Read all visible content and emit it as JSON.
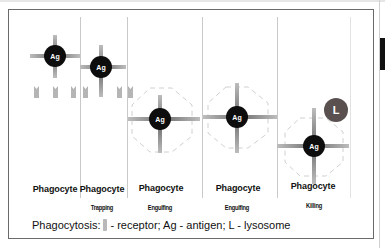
{
  "diagram": {
    "title": "Phagocytosis",
    "colors": {
      "antigen": "#0d0d0d",
      "antigen_text": "#ffffff",
      "arms": "#8a8a8a",
      "receptor": "#b5b5b5",
      "lysosome": "#5a5050",
      "membrane_dash": "#d2d2d2",
      "divider": "#c9c9c9"
    },
    "panels": [
      {
        "cell_label": "Phagocyte",
        "stage": "",
        "antigen": {
          "label": "Ag",
          "cx": 55,
          "cy": 56
        }
      },
      {
        "cell_label": "Phagocyte",
        "stage": "Trapping",
        "antigen": {
          "label": "Ag",
          "cx": 101,
          "cy": 67
        }
      },
      {
        "cell_label": "Phagocyte",
        "stage": "Engulfing",
        "antigen": {
          "label": "Ag",
          "cx": 160,
          "cy": 119
        }
      },
      {
        "cell_label": "Phagocyte",
        "stage": "Engulfing",
        "antigen": {
          "label": "Ag",
          "cx": 237,
          "cy": 117
        }
      },
      {
        "cell_label": "Phagocyte",
        "stage": "Killing",
        "antigen": {
          "label": "Ag",
          "cx": 314,
          "cy": 146
        }
      }
    ],
    "lysosome": {
      "label": "L",
      "cx": 336,
      "cy": 110
    },
    "legend": {
      "prefix": "Phagocytosis:",
      "receptor_text": "- receptor; Ag - antigen; L - lysosome"
    }
  }
}
